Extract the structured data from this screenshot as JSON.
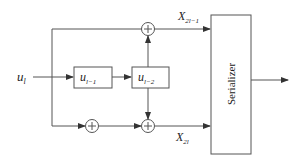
{
  "diagram": {
    "input": {
      "symbol": "u",
      "subscript": "l"
    },
    "delays": [
      {
        "symbol": "u",
        "subscript": "l−1"
      },
      {
        "symbol": "u",
        "subscript": "l−2"
      }
    ],
    "adders": [
      {
        "id": "top",
        "glyph": "+"
      },
      {
        "id": "bottom-left",
        "glyph": "+"
      },
      {
        "id": "bottom-right",
        "glyph": "+"
      }
    ],
    "outputs": [
      {
        "symbol": "X",
        "subscript": "2l−1"
      },
      {
        "symbol": "X",
        "subscript": "2l"
      }
    ],
    "serializer": {
      "label": "Serializer"
    },
    "colors": {
      "stroke": "#555555",
      "text": "#222222",
      "background": "#ffffff"
    }
  }
}
